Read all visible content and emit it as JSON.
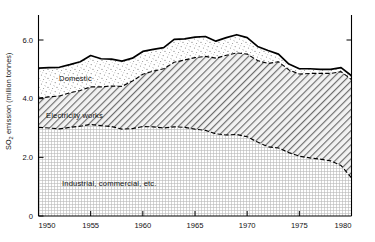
{
  "chart_data": {
    "type": "area",
    "stacked": true,
    "title": "",
    "xlabel": "",
    "ylabel": "SO₂ emission (million tonnes)",
    "ylabel_plain": "SO2 emission (million tonnes)",
    "xlim": [
      1950,
      1980
    ],
    "ylim": [
      0,
      6.75
    ],
    "xticks": [
      1950,
      1955,
      1960,
      1965,
      1970,
      1975,
      1980
    ],
    "xticklabels": [
      "1950",
      "1955",
      "1960",
      "1965",
      "1970",
      "1975",
      "1980"
    ],
    "yticks": [
      0,
      2.0,
      4.0,
      6.0
    ],
    "yticklabels": [
      "0",
      "2.0",
      "4.0",
      "6.0"
    ],
    "grid": false,
    "legend": "in-plot band labels",
    "x": [
      1950,
      1951,
      1952,
      1953,
      1954,
      1955,
      1956,
      1957,
      1958,
      1959,
      1960,
      1961,
      1962,
      1963,
      1964,
      1965,
      1966,
      1967,
      1968,
      1969,
      1970,
      1971,
      1972,
      1973,
      1974,
      1975,
      1976,
      1977,
      1978,
      1979,
      1980
    ],
    "series": [
      {
        "name": "Industrial, commercial, etc.",
        "fill": "fine-dot-grid",
        "values": [
          3.02,
          3.0,
          2.97,
          3.02,
          3.06,
          3.12,
          3.08,
          3.05,
          2.96,
          2.98,
          3.05,
          3.04,
          3.0,
          3.04,
          3.02,
          2.96,
          2.92,
          2.8,
          2.76,
          2.78,
          2.7,
          2.52,
          2.36,
          2.32,
          2.16,
          2.04,
          1.98,
          1.94,
          1.88,
          1.72,
          1.3
        ]
      },
      {
        "name": "Electricity works",
        "fill": "diagonal-hatch",
        "values": [
          1.0,
          1.06,
          1.12,
          1.18,
          1.22,
          1.28,
          1.32,
          1.38,
          1.46,
          1.62,
          1.78,
          1.9,
          2.02,
          2.2,
          2.3,
          2.44,
          2.52,
          2.58,
          2.72,
          2.78,
          2.82,
          2.78,
          2.84,
          2.94,
          2.82,
          2.8,
          2.88,
          2.92,
          2.98,
          3.2,
          3.35
        ]
      },
      {
        "name": "Domestic",
        "fill": "stipple",
        "values": [
          1.02,
          1.0,
          0.98,
          0.96,
          0.98,
          1.07,
          0.96,
          0.92,
          0.86,
          0.78,
          0.78,
          0.74,
          0.72,
          0.78,
          0.72,
          0.7,
          0.68,
          0.58,
          0.6,
          0.62,
          0.56,
          0.48,
          0.44,
          0.26,
          0.2,
          0.18,
          0.16,
          0.14,
          0.14,
          0.14,
          0.13
        ]
      }
    ],
    "totals": [
      5.04,
      5.06,
      5.07,
      5.16,
      5.26,
      5.47,
      5.36,
      5.35,
      5.28,
      5.38,
      5.61,
      5.68,
      5.74,
      6.02,
      6.04,
      6.1,
      6.12,
      5.96,
      6.08,
      6.18,
      6.08,
      5.78,
      5.64,
      5.52,
      5.18,
      5.02,
      5.02,
      5.0,
      5.0,
      5.06,
      4.78
    ]
  },
  "band_labels": [
    {
      "name": "Domestic",
      "text": "Domestic"
    },
    {
      "name": "Electricity works",
      "text": "Electricity works"
    },
    {
      "name": "Industrial, commercial, etc.",
      "text": "Industrial, commercial, etc."
    }
  ],
  "axis": {
    "y_title": "SO₂ emission (million tonnes)",
    "y_title_prefix": "SO",
    "y_title_sub": "2",
    "y_title_suffix": " emission (million tonnes)"
  }
}
